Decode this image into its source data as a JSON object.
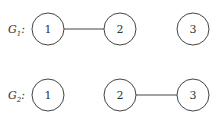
{
  "graphs": [
    {
      "label": "G",
      "subscript": "1",
      "suffix": ":",
      "nodes": [
        {
          "id": "1",
          "label": "1"
        },
        {
          "id": "2",
          "label": "2"
        },
        {
          "id": "3",
          "label": "3"
        }
      ],
      "edges": [
        [
          "1",
          "2"
        ]
      ]
    },
    {
      "label": "G",
      "subscript": "2",
      "suffix": ":",
      "nodes": [
        {
          "id": "1",
          "label": "1"
        },
        {
          "id": "2",
          "label": "2"
        },
        {
          "id": "3",
          "label": "3"
        }
      ],
      "edges": [
        [
          "2",
          "3"
        ]
      ]
    }
  ]
}
